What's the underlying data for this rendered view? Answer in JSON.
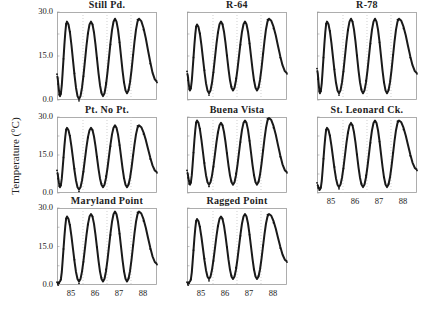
{
  "figure": {
    "ylabel": "Temperature (°C)",
    "y_ticks": [
      "30.0",
      "15.0",
      "0.0"
    ],
    "x_ticks": [
      "85",
      "86",
      "87",
      "88"
    ]
  },
  "chart_data": {
    "type": "line",
    "title": "",
    "xlabel": "",
    "ylabel": "Temperature (°C)",
    "ylim": [
      0,
      30
    ],
    "xlim": [
      84.6,
      88.6
    ],
    "x_tick_labels": [
      "85",
      "86",
      "87",
      "88"
    ],
    "y_tick_labels": [
      "0.0",
      "15.0",
      "30.0"
    ],
    "grid": "vertical dotted lines at year boundaries",
    "panels": [
      {
        "name": "Still Pd.",
        "row": 0,
        "col": 0,
        "peaks": [
          27,
          27,
          28,
          28
        ],
        "troughs": [
          1,
          0,
          1,
          2
        ],
        "start": 8,
        "end": 6
      },
      {
        "name": "R-64",
        "row": 0,
        "col": 1,
        "peaks": [
          26,
          27,
          27,
          28
        ],
        "troughs": [
          3,
          2,
          3,
          3
        ],
        "start": 9,
        "end": 9
      },
      {
        "name": "R-78",
        "row": 0,
        "col": 2,
        "peaks": [
          27,
          28,
          28,
          28
        ],
        "troughs": [
          2,
          2,
          2,
          2
        ],
        "start": 10,
        "end": 9
      },
      {
        "name": "Pt. No Pt.",
        "row": 1,
        "col": 0,
        "peaks": [
          26,
          26,
          27,
          27
        ],
        "troughs": [
          2,
          1,
          2,
          2
        ],
        "start": 8,
        "end": 8
      },
      {
        "name": "Buena Vista",
        "row": 1,
        "col": 1,
        "peaks": [
          29,
          28,
          29,
          30
        ],
        "troughs": [
          3,
          3,
          3,
          3
        ],
        "start": 8,
        "end": 8
      },
      {
        "name": "St. Leonard Ck.",
        "row": 1,
        "col": 2,
        "peaks": [
          26,
          28,
          29,
          29
        ],
        "troughs": [
          1,
          2,
          2,
          2
        ],
        "start": 3,
        "end": 9
      },
      {
        "name": "Maryland Point",
        "row": 2,
        "col": 0,
        "peaks": [
          27,
          28,
          29,
          29
        ],
        "troughs": [
          1,
          1,
          1,
          1
        ],
        "start": 0,
        "end": 8
      },
      {
        "name": "Ragged Point",
        "row": 2,
        "col": 1,
        "peaks": [
          26,
          27,
          28,
          28
        ],
        "troughs": [
          1,
          2,
          2,
          2
        ],
        "start": 0,
        "end": 9
      }
    ]
  }
}
